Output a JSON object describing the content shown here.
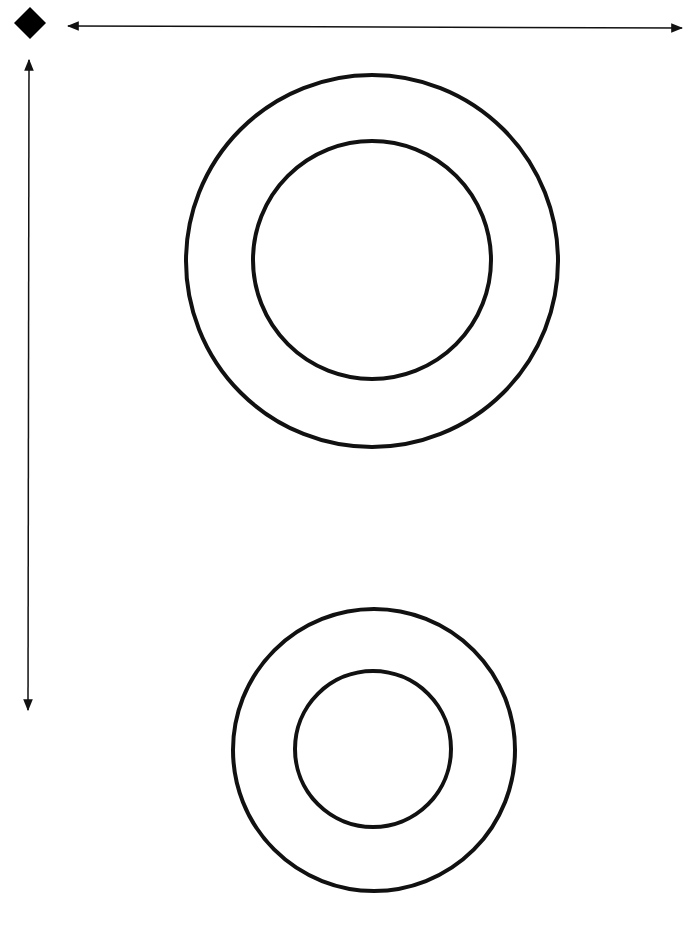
{
  "diagram": {
    "marker": {
      "shape": "diamond",
      "cx": 30,
      "cy": 23,
      "size": 16,
      "color": "#000000"
    },
    "arrows": [
      {
        "id": "horizontal",
        "x1": 68,
        "y1": 26,
        "x2": 682,
        "y2": 28,
        "heads": "both"
      },
      {
        "id": "vertical",
        "x1": 29,
        "y1": 60,
        "x2": 28,
        "y2": 710,
        "heads": "both"
      }
    ],
    "rings": [
      {
        "id": "top",
        "cx": 372,
        "cy": 261,
        "outer_r": 186,
        "inner_r": 119
      },
      {
        "id": "bottom",
        "cx": 374,
        "cy": 750,
        "outer_r": 141,
        "inner_r": 78
      }
    ],
    "stroke_color": "#111111",
    "stroke_width": 4
  }
}
